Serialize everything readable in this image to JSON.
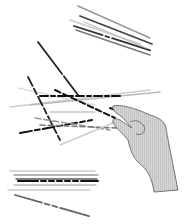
{
  "illustration": {
    "subject": "pick-up sticks game with hand lifting a stick",
    "background": "#ffffff",
    "colors": {
      "stick_dark": "#222222",
      "stick_mid": "#888888",
      "stick_light": "#cccccc",
      "hand_fill": "#bdbdbd",
      "hand_stroke": "#555555"
    },
    "groups": [
      {
        "name": "top-right-stick-bundle"
      },
      {
        "name": "central-stick-pile"
      },
      {
        "name": "hand"
      },
      {
        "name": "bottom-stick-bundle"
      },
      {
        "name": "single-bottom-stick"
      }
    ]
  }
}
